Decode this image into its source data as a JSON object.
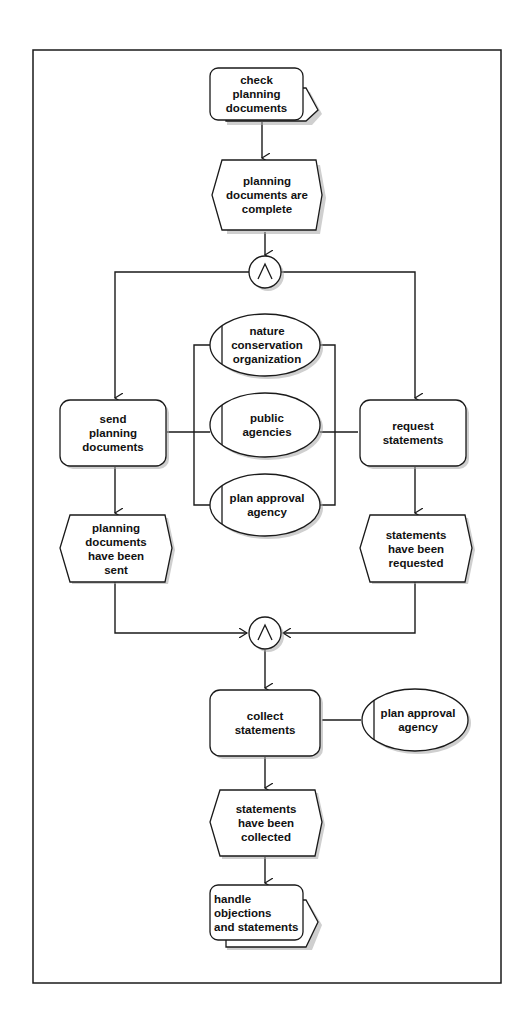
{
  "diagram": {
    "type": "event-driven process chain",
    "colors": {
      "stroke": "#1a1a1a",
      "fill": "#ffffff",
      "shadow": "#9a9a9a",
      "background": "#ffffff"
    },
    "nodes": {
      "check_planning_documents": {
        "kind": "process-path function",
        "label": "check\nplanning\ndocuments"
      },
      "planning_documents_complete": {
        "kind": "event",
        "label": "planning\ndocuments are\ncomplete"
      },
      "and_split": {
        "kind": "AND connector",
        "symbol": "∧"
      },
      "send_planning_documents": {
        "kind": "function",
        "label": "send\nplanning\ndocuments"
      },
      "nature_conservation_organization": {
        "kind": "organizational unit",
        "label": "nature\nconservation\norganization"
      },
      "public_agencies": {
        "kind": "organizational unit",
        "label": "public\nagencies"
      },
      "plan_approval_agency_1": {
        "kind": "organizational unit",
        "label": "plan approval\nagency"
      },
      "request_statements": {
        "kind": "function",
        "label": "request\nstatements"
      },
      "planning_documents_sent": {
        "kind": "event",
        "label": "planning\ndocuments\nhave been\nsent"
      },
      "statements_requested": {
        "kind": "event",
        "label": "statements\nhave been\nrequested"
      },
      "and_join": {
        "kind": "AND connector",
        "symbol": "∧"
      },
      "collect_statements": {
        "kind": "function",
        "label": "collect\nstatements"
      },
      "plan_approval_agency_2": {
        "kind": "organizational unit",
        "label": "plan approval\nagency"
      },
      "statements_collected": {
        "kind": "event",
        "label": "statements\nhave been\ncollected"
      },
      "handle_objections": {
        "kind": "process-path function",
        "label": "handle\nobjections\nand statements"
      }
    },
    "edges": [
      [
        "check_planning_documents",
        "planning_documents_complete"
      ],
      [
        "planning_documents_complete",
        "and_split"
      ],
      [
        "and_split",
        "send_planning_documents"
      ],
      [
        "and_split",
        "request_statements"
      ],
      [
        "send_planning_documents",
        "planning_documents_sent"
      ],
      [
        "request_statements",
        "statements_requested"
      ],
      [
        "planning_documents_sent",
        "and_join"
      ],
      [
        "statements_requested",
        "and_join"
      ],
      [
        "and_join",
        "collect_statements"
      ],
      [
        "collect_statements",
        "statements_collected"
      ],
      [
        "statements_collected",
        "handle_objections"
      ]
    ],
    "associations": [
      [
        "send_planning_documents",
        "nature_conservation_organization"
      ],
      [
        "send_planning_documents",
        "public_agencies"
      ],
      [
        "send_planning_documents",
        "plan_approval_agency_1"
      ],
      [
        "request_statements",
        "nature_conservation_organization"
      ],
      [
        "request_statements",
        "public_agencies"
      ],
      [
        "request_statements",
        "plan_approval_agency_1"
      ],
      [
        "collect_statements",
        "plan_approval_agency_2"
      ]
    ]
  }
}
